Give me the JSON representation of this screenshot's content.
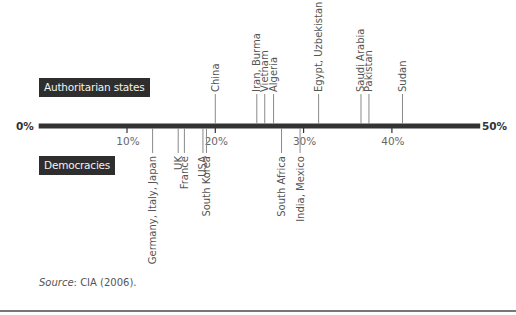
{
  "chart_data": {
    "type": "timeline-scale",
    "title": "",
    "axis": {
      "min": 0,
      "max": 50,
      "unit": "%",
      "end_labels": [
        "0%",
        "50%"
      ],
      "ticks": [
        10,
        20,
        30,
        40
      ],
      "tick_labels": [
        "10%",
        "20%",
        "30%",
        "40%"
      ]
    },
    "series": [
      {
        "name": "Authoritarian states",
        "position": "above",
        "points": [
          {
            "label": "China",
            "value": 20
          },
          {
            "label": "Iran, Burma",
            "value": 24.7
          },
          {
            "label": "Vietnam",
            "value": 25.6
          },
          {
            "label": "Algeria",
            "value": 26.6
          },
          {
            "label": "Egypt, Uzbekistan",
            "value": 31.7
          },
          {
            "label": "Saudi Arabia",
            "value": 36.5
          },
          {
            "label": "Pakistan",
            "value": 37.4
          },
          {
            "label": "Sudan",
            "value": 41.2
          }
        ]
      },
      {
        "name": "Democracies",
        "position": "below",
        "points": [
          {
            "label": "Germany, Italy, Japan",
            "value": 12.9
          },
          {
            "label": "UK",
            "value": 15.8
          },
          {
            "label": "France",
            "value": 16.5
          },
          {
            "label": "USA",
            "value": 18.6
          },
          {
            "label": "South Korea",
            "value": 19.0
          },
          {
            "label": "South Africa",
            "value": 27.5
          },
          {
            "label": "India, Mexico",
            "value": 29.6
          }
        ]
      }
    ],
    "legend": [
      "Authoritarian states",
      "Democracies"
    ],
    "grid": false
  },
  "labels": {
    "authoritarian_tag": "Authoritarian states",
    "democracies_tag": "Democracies",
    "zero": "0%",
    "fifty": "50%"
  },
  "source": {
    "prefix": "Source",
    "text": ": CIA (2006)."
  },
  "colors": {
    "axis": "#333333",
    "leader": "#8a8a8a",
    "text": "#555555",
    "tag_bg": "#2e2e2e",
    "tag_text": "#f2f2f2"
  }
}
